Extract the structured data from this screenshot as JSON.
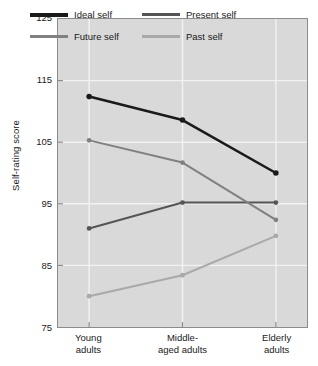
{
  "chart_data": {
    "type": "line",
    "title": "",
    "xlabel": "",
    "ylabel": "Self-rating score",
    "categories": [
      "Young adults",
      "Middle-aged adults",
      "Elderly adults"
    ],
    "category_lines": [
      [
        "Young",
        "adults"
      ],
      [
        "Middle-",
        "aged adults"
      ],
      [
        "Elderly",
        "adults"
      ]
    ],
    "ylim": [
      75,
      125
    ],
    "yticks": [
      125,
      115,
      105,
      95,
      85,
      75
    ],
    "ytick_labels": [
      "125",
      "115",
      "105",
      "95",
      "85",
      "75"
    ],
    "grid": true,
    "legend_position": "top-inside",
    "series": [
      {
        "name": "Ideal self",
        "color": "#1a1a1a",
        "values": [
          112.4,
          108.6,
          100.0
        ]
      },
      {
        "name": "Present self",
        "color": "#555555",
        "values": [
          91.0,
          95.2,
          95.2
        ]
      },
      {
        "name": "Future self",
        "color": "#808080",
        "values": [
          105.3,
          101.7,
          92.4
        ]
      },
      {
        "name": "Past self",
        "color": "#a9a9a9",
        "values": [
          80.0,
          83.4,
          89.8
        ]
      }
    ]
  },
  "legend": {
    "items": [
      {
        "label": "Ideal self",
        "color": "#1a1a1a"
      },
      {
        "label": "Present self",
        "color": "#555555"
      },
      {
        "label": "Future self",
        "color": "#808080"
      },
      {
        "label": "Past self",
        "color": "#a9a9a9"
      }
    ]
  },
  "axes": {
    "y_title": "Self-rating score",
    "y_ticks": [
      "125",
      "115",
      "105",
      "95",
      "85",
      "75"
    ],
    "x_ticks": [
      "Young adults",
      "Middle-aged adults",
      "Elderly adults"
    ]
  },
  "colors": {
    "plot_background": "#d9d9d9",
    "grid": "#f2f2f2",
    "axis": "#8c8c8c",
    "text": "#1a1a1a"
  }
}
